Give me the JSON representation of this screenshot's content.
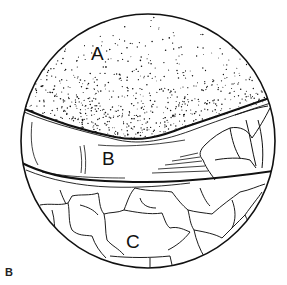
{
  "figure": {
    "panel_label": "B",
    "regions": [
      {
        "id": "A",
        "label": "A",
        "description": "stippled upper region"
      },
      {
        "id": "B",
        "label": "B",
        "description": "smooth horizontal band"
      },
      {
        "id": "C",
        "label": "C",
        "description": "polygonal cell mosaic lower region"
      }
    ],
    "colors": {
      "ink": "#111111",
      "background": "#ffffff"
    }
  }
}
